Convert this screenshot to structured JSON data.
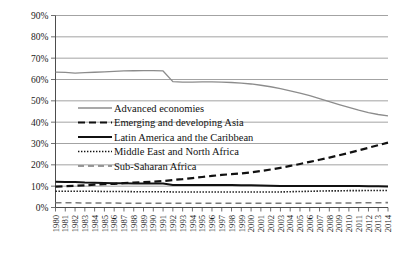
{
  "chart_data": {
    "type": "line",
    "title": "",
    "subtitle": "",
    "xlabel": "",
    "ylabel": "",
    "ylim": [
      0,
      90
    ],
    "xlim": [
      1980,
      2014
    ],
    "grid": true,
    "legend_position": "inside-upper-left",
    "ytick_labels": [
      "0%",
      "10%",
      "20%",
      "30%",
      "40%",
      "50%",
      "60%",
      "70%",
      "80%",
      "90%"
    ],
    "ytick_values": [
      0,
      10,
      20,
      30,
      40,
      50,
      60,
      70,
      80,
      90
    ],
    "categories": [
      "1980",
      "1981",
      "1982",
      "1983",
      "1984",
      "1985",
      "1986",
      "1987",
      "1988",
      "1989",
      "1990",
      "1991",
      "1992",
      "1993",
      "1994",
      "1995",
      "1996",
      "1997",
      "1998",
      "1999",
      "2000",
      "2001",
      "2002",
      "2003",
      "2004",
      "2005",
      "2006",
      "2007",
      "2008",
      "2009",
      "2010",
      "2011",
      "2012",
      "2013",
      "2014"
    ],
    "series": [
      {
        "name": "Advanced economies",
        "style": "solid-gray",
        "color": "#8c8c8c",
        "width": 1.3,
        "dash": "",
        "values": [
          63.5,
          63.3,
          63.0,
          63.2,
          63.4,
          63.6,
          63.8,
          64.0,
          64.1,
          64.2,
          64.2,
          64.0,
          59.0,
          58.8,
          58.8,
          58.9,
          58.9,
          58.8,
          58.6,
          58.3,
          57.9,
          57.3,
          56.6,
          55.7,
          54.7,
          53.6,
          52.4,
          51.0,
          49.6,
          48.2,
          46.9,
          45.6,
          44.5,
          43.6,
          43.0
        ]
      },
      {
        "name": "Emerging and developing Asia",
        "style": "dashed-black",
        "color": "#111111",
        "width": 2.2,
        "dash": "7,4",
        "values": [
          9.8,
          10.0,
          10.2,
          10.4,
          10.7,
          10.9,
          11.1,
          11.4,
          11.7,
          11.9,
          12.1,
          12.4,
          12.9,
          13.3,
          13.8,
          14.3,
          14.8,
          15.3,
          15.6,
          16.0,
          16.5,
          17.1,
          17.8,
          18.6,
          19.5,
          20.4,
          21.4,
          22.4,
          23.4,
          24.5,
          25.6,
          26.8,
          28.0,
          29.2,
          30.4
        ]
      },
      {
        "name": "Latin America and the Caribbean",
        "style": "solid-black-thick",
        "color": "#111111",
        "width": 2.0,
        "dash": "",
        "values": [
          12.1,
          12.0,
          11.9,
          11.7,
          11.6,
          11.5,
          11.4,
          11.4,
          11.3,
          11.3,
          11.2,
          11.2,
          10.6,
          10.6,
          10.6,
          10.5,
          10.5,
          10.5,
          10.5,
          10.4,
          10.4,
          10.3,
          10.2,
          10.1,
          10.1,
          10.1,
          10.1,
          10.1,
          10.1,
          10.1,
          10.1,
          10.1,
          10.0,
          10.0,
          9.9
        ]
      },
      {
        "name": "Middle East and North Africa",
        "style": "dotted-black",
        "color": "#111111",
        "width": 1.6,
        "dash": "1.4,1.6",
        "values": [
          7.6,
          7.6,
          7.6,
          7.6,
          7.6,
          7.5,
          7.5,
          7.5,
          7.4,
          7.4,
          7.4,
          7.4,
          7.3,
          7.3,
          7.3,
          7.3,
          7.3,
          7.3,
          7.3,
          7.3,
          7.3,
          7.3,
          7.3,
          7.3,
          7.4,
          7.5,
          7.6,
          7.7,
          7.8,
          7.8,
          7.9,
          7.9,
          8.0,
          8.0,
          8.0
        ]
      },
      {
        "name": "Sub-Saharan Africa",
        "style": "long-dash-gray",
        "color": "#7a7a7a",
        "width": 1.6,
        "dash": "6,4",
        "values": [
          2.2,
          2.2,
          2.2,
          2.1,
          2.1,
          2.1,
          2.1,
          2.0,
          2.0,
          2.0,
          2.0,
          2.0,
          2.0,
          2.0,
          2.0,
          2.0,
          2.0,
          2.0,
          2.0,
          2.0,
          2.0,
          2.0,
          2.0,
          2.0,
          2.0,
          2.0,
          2.0,
          2.0,
          2.1,
          2.1,
          2.1,
          2.2,
          2.2,
          2.2,
          2.3
        ]
      }
    ],
    "legend": [
      {
        "label": "Advanced economies",
        "swatch": "solid-gray"
      },
      {
        "label": "Emerging and developing Asia",
        "swatch": "dashed-black"
      },
      {
        "label": "Latin America and the Caribbean",
        "swatch": "solid-black-thick"
      },
      {
        "label": "Middle East and North Africa",
        "swatch": "dotted-black"
      },
      {
        "label": "Sub-Saharan Africa",
        "swatch": "long-dash-gray"
      }
    ]
  }
}
